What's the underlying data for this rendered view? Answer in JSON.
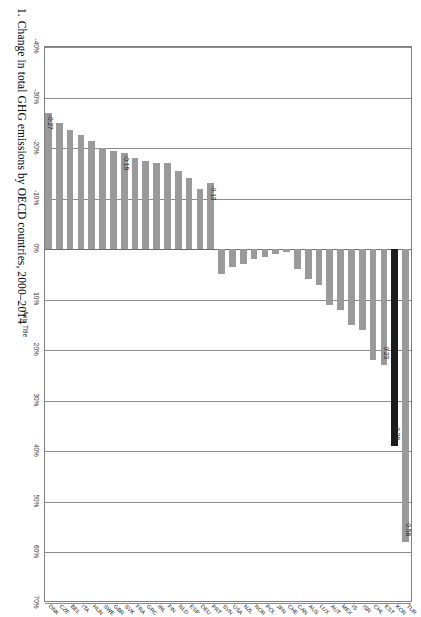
{
  "figure": {
    "caption_number": "1.",
    "caption_text": "Change in total GHG emissions by OECD countries, 2000–2014"
  },
  "axes": {
    "value_axis_title": "Axis Title",
    "value_ticks": [
      "-40%",
      "-30%",
      "-20%",
      "-10%",
      "0%",
      "10%",
      "20%",
      "30%",
      "40%",
      "50%",
      "60%",
      "70%"
    ],
    "value_min": -0.4,
    "value_max": 0.7,
    "gridline_step": 0.1,
    "grid_on": true
  },
  "colors": {
    "bar": "#9a9a9a",
    "bar_highlight": "#1c1c1c",
    "grid": "#8c8c8c",
    "frame": "#7f7f7f",
    "text": "#222222"
  },
  "chart_data": {
    "type": "bar",
    "orientation": "horizontal",
    "title": "",
    "subtitle": "",
    "xlabel": "Axis Title",
    "ylabel": "",
    "xlim": [
      -0.4,
      0.7
    ],
    "grid": true,
    "legend": "none",
    "value_format": "percent",
    "highlight_category": "KOR",
    "categories": [
      "TUR",
      "KOR",
      "EST",
      "CHL",
      "ISR",
      "IS",
      "MEX",
      "AUT",
      "LUX",
      "AUS",
      "CAN",
      "CHE",
      "JPN",
      "POL",
      "NOR",
      "NZL",
      "USA",
      "SVN",
      "PRT",
      "DEU",
      "ESP",
      "NLD",
      "FIN",
      "IRL",
      "GRC",
      "FRA",
      "SVK",
      "GBR",
      "SWE",
      "HUN",
      "ITA",
      "BEL",
      "CZE",
      "DNK"
    ],
    "values": [
      0.58,
      0.39,
      0.23,
      0.22,
      0.16,
      0.15,
      0.12,
      0.11,
      0.07,
      0.06,
      0.04,
      0.005,
      0.01,
      0.015,
      0.02,
      0.03,
      0.035,
      0.05,
      -0.13,
      -0.12,
      -0.14,
      -0.155,
      -0.17,
      -0.17,
      -0.175,
      -0.18,
      -0.19,
      -0.195,
      -0.2,
      -0.215,
      -0.225,
      -0.235,
      -0.25,
      -0.27
    ],
    "data_labels": [
      {
        "category": "TUR",
        "value": 0.58,
        "text": "0.58"
      },
      {
        "category": "KOR",
        "value": 0.39,
        "text": "0.39"
      },
      {
        "category": "EST",
        "value": 0.23,
        "text": "0.23"
      },
      {
        "category": "PRT",
        "value": -0.13,
        "text": "-0.13"
      },
      {
        "category": "SVK",
        "value": -0.19,
        "text": "-0.19"
      },
      {
        "category": "DNK",
        "value": -0.27,
        "text": "-0.27"
      }
    ]
  }
}
